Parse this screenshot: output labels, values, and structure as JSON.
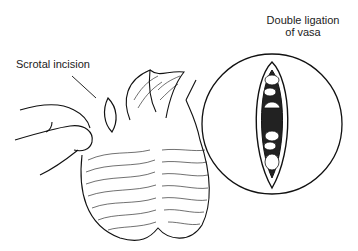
{
  "figure": {
    "labels": {
      "scrotal_incision": "Scrotal incision",
      "double_ligation_line1": "Double ligation",
      "double_ligation_line2": "of vasa"
    }
  }
}
